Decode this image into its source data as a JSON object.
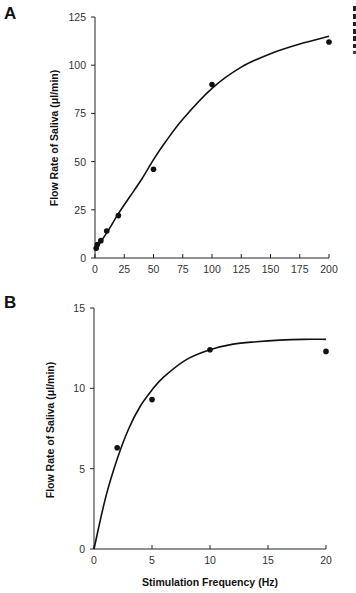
{
  "chart_data": [
    {
      "panel": "A",
      "type": "scatter",
      "title": "",
      "xlabel": "",
      "ylabel": "Flow Rate of Saliva (μl/min)",
      "xlim": [
        0,
        200
      ],
      "ylim": [
        0,
        125
      ],
      "xticks": [
        0,
        25,
        50,
        75,
        100,
        125,
        150,
        175,
        200
      ],
      "yticks": [
        0,
        25,
        50,
        75,
        100,
        125
      ],
      "grid": false,
      "series": [
        {
          "name": "measured",
          "kind": "points",
          "x": [
            1,
            2,
            5,
            10,
            20,
            50,
            100,
            200
          ],
          "y": [
            5,
            7,
            9,
            14,
            22,
            46,
            90,
            112
          ]
        },
        {
          "name": "fit",
          "kind": "line",
          "x": [
            0,
            10,
            20,
            30,
            40,
            50,
            60,
            75,
            100,
            125,
            150,
            175,
            200
          ],
          "y": [
            4,
            13,
            23,
            32,
            41,
            51,
            60,
            72,
            88,
            99,
            106,
            111,
            115
          ]
        }
      ]
    },
    {
      "panel": "B",
      "type": "scatter",
      "title": "",
      "xlabel": "Stimulation Frequency (Hz)",
      "ylabel": "Flow Rate of Saliva (μl/min)",
      "xlim": [
        0,
        20
      ],
      "ylim": [
        0,
        15
      ],
      "xticks": [
        0,
        5,
        10,
        15,
        20
      ],
      "yticks": [
        0,
        5,
        10,
        15
      ],
      "grid": false,
      "series": [
        {
          "name": "measured",
          "kind": "points",
          "x": [
            2,
            5,
            10,
            20
          ],
          "y": [
            6.3,
            9.3,
            12.4,
            12.3
          ]
        },
        {
          "name": "fit",
          "kind": "line",
          "x": [
            0,
            1,
            2,
            3,
            4,
            5,
            6,
            8,
            10,
            12,
            14,
            16,
            18,
            20
          ],
          "y": [
            0,
            3.2,
            5.6,
            7.5,
            8.9,
            9.9,
            10.7,
            11.8,
            12.4,
            12.75,
            12.9,
            13.0,
            13.05,
            13.05
          ]
        }
      ]
    }
  ],
  "labels": {
    "panel_a": "A",
    "panel_b": "B",
    "ylabel_a": "Flow Rate of Saliva (μl/min)",
    "ylabel_b": "Flow Rate of Saliva (μl/min)",
    "xlabel_b": "Stimulation Frequency (Hz)"
  }
}
